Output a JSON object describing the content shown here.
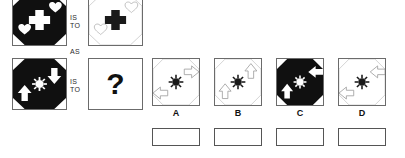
{
  "puzzle": {
    "type": "visual-analogy",
    "connectors": {
      "is_to_1": "IS\nTO",
      "as": "AS",
      "is_to_2": "IS\nTO"
    },
    "question_mark": "?",
    "colors": {
      "ink": "#111111",
      "frame": "#6b6b6b",
      "light_outline": "#b9b9b9",
      "black_fill": "#101010",
      "white_fill": "#ffffff"
    }
  },
  "stimulus": {
    "panel_a": {
      "name": "top-left-figure",
      "ground": "black",
      "shape": "octagon",
      "center_icon": "cross",
      "center_icon_color": "white",
      "satellites": [
        "heart-upper-right",
        "heart-lower-left"
      ],
      "satellite_color": "white"
    },
    "panel_b": {
      "name": "top-right-figure",
      "ground": "white",
      "shape": "octagon",
      "center_icon": "cross",
      "center_icon_color": "black",
      "satellites": [
        "heart-upper-right",
        "heart-lower-left"
      ],
      "satellite_color": "outline"
    },
    "panel_c": {
      "name": "bottom-left-figure",
      "ground": "black",
      "shape": "octagon",
      "center_icon": "sun",
      "center_icon_color": "white",
      "satellites": [
        "arrow-down-right",
        "arrow-up-left"
      ],
      "satellite_color": "white"
    },
    "panel_d": {
      "name": "answer-slot",
      "label": "?"
    }
  },
  "options": [
    {
      "id": "A",
      "label": "A",
      "ground": "white",
      "shape": "octagon",
      "center_icon": "sun",
      "center_icon_color": "black",
      "satellites": [
        "arrow-right-upper",
        "arrow-left-lower"
      ],
      "satellite_color": "outline"
    },
    {
      "id": "B",
      "label": "B",
      "ground": "white",
      "shape": "octagon",
      "center_icon": "sun",
      "center_icon_color": "black",
      "satellites": [
        "arrow-up-right",
        "arrow-up-left"
      ],
      "satellite_color": "outline"
    },
    {
      "id": "C",
      "label": "C",
      "ground": "black",
      "shape": "octagon",
      "center_icon": "sun",
      "center_icon_color": "white",
      "satellites": [
        "arrow-left-upper",
        "arrow-up-lower"
      ],
      "satellite_color": "white"
    },
    {
      "id": "D",
      "label": "D",
      "ground": "white",
      "shape": "octagon",
      "center_icon": "sun",
      "center_icon_color": "black",
      "satellites": [
        "arrow-left-upper",
        "arrow-left-lower"
      ],
      "satellite_color": "outline"
    }
  ],
  "answer_boxes": [
    {
      "id": "box-a",
      "value": ""
    },
    {
      "id": "box-b",
      "value": ""
    },
    {
      "id": "box-c",
      "value": ""
    },
    {
      "id": "box-d",
      "value": ""
    }
  ]
}
